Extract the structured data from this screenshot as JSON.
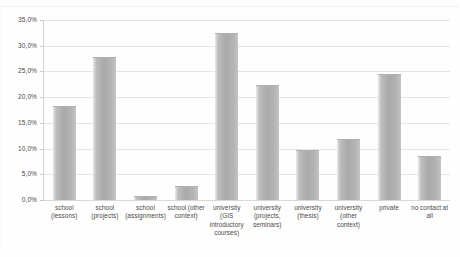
{
  "chart_data": {
    "type": "bar",
    "title": "",
    "subtitle": "",
    "xlabel": "",
    "ylabel": "",
    "ylim": [
      0,
      35
    ],
    "y_tick_step": 5,
    "grid": true,
    "legend": false,
    "value_format": "percent-comma",
    "categories": [
      "school (lessons)",
      "school (projects)",
      "school (assignments)",
      "school (other context)",
      "university (GIS introductory courses)",
      "university (projects, seminars)",
      "university (thesis)",
      "university (other context)",
      "private",
      "no contact at all"
    ],
    "values": [
      18.3,
      27.8,
      0.7,
      2.8,
      32.4,
      22.4,
      9.8,
      11.8,
      24.5,
      8.5
    ],
    "y_tick_labels": [
      "35,0%",
      "30,0%",
      "25,0%",
      "20,0%",
      "15,0%",
      "10,0%",
      "5,0%",
      "0,0%"
    ],
    "y_tick_values": [
      35,
      30,
      25,
      20,
      15,
      10,
      5,
      0
    ],
    "colors": {
      "bar_fill": "#a9a9a9",
      "bar_highlight": "#e9e9e9",
      "gridline": "#e4e4e4",
      "axis": "#d2d2d2",
      "text": "#4a4a4a",
      "background": "#ffffff"
    }
  }
}
